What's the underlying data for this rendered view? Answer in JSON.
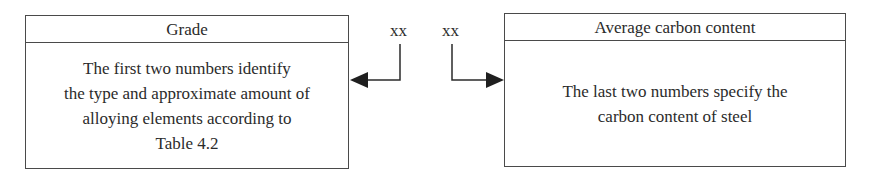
{
  "diagram": {
    "left_box": {
      "title": "Grade",
      "lines": [
        "The first two numbers identify",
        "the type and approximate amount of",
        "alloying elements according to",
        "Table 4.2"
      ]
    },
    "codes": {
      "first": "xx",
      "second": "xx"
    },
    "right_box": {
      "title": "Average carbon content",
      "lines": [
        "The last two numbers specify the",
        "carbon content of steel"
      ]
    },
    "colors": {
      "line": "#2b2b2b",
      "border": "#4a4a4a",
      "background": "#ffffff"
    }
  }
}
